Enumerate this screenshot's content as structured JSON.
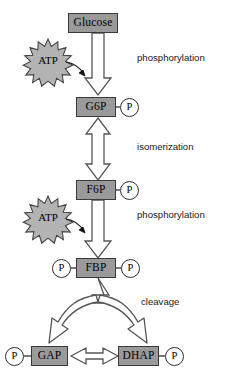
{
  "diagram": {
    "colors": {
      "box_fill": "#9a9a9a",
      "box_stroke": "#3a3a3a",
      "arrow_fill": "#ffffff",
      "arrow_stroke": "#555555",
      "star_fill": "#b3b3b3",
      "star_stroke": "#444444",
      "text": "#000000",
      "background": "#ffffff"
    },
    "metabolites": [
      {
        "id": "glucose",
        "label": "Glucose"
      },
      {
        "id": "g6p",
        "label": "G6P"
      },
      {
        "id": "f6p",
        "label": "F6P"
      },
      {
        "id": "fbp",
        "label": "FBP"
      },
      {
        "id": "gap",
        "label": "GAP"
      },
      {
        "id": "dhap",
        "label": "DHAP"
      }
    ],
    "phosphate_groups": [
      {
        "id": "p-g6p",
        "label": "P"
      },
      {
        "id": "p-f6p",
        "label": "P"
      },
      {
        "id": "p-fbp-left",
        "label": "P"
      },
      {
        "id": "p-fbp-right",
        "label": "P"
      },
      {
        "id": "p-gap",
        "label": "P"
      },
      {
        "id": "p-dhap",
        "label": "P"
      }
    ],
    "cofactors": [
      {
        "id": "atp-1",
        "label": "ATP"
      },
      {
        "id": "atp-2",
        "label": "ATP"
      }
    ],
    "process_labels": [
      {
        "id": "phosphorylation-1",
        "label": "phosphorylation"
      },
      {
        "id": "isomerization",
        "label": "isomerization"
      },
      {
        "id": "phosphorylation-2",
        "label": "phosphorylation"
      },
      {
        "id": "cleavage",
        "label": "cleavage"
      }
    ]
  }
}
